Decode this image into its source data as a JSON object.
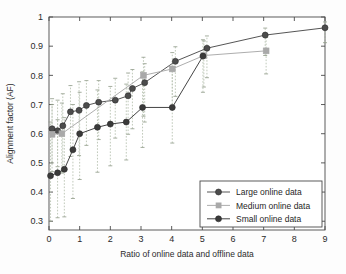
{
  "chart_data": {
    "type": "line",
    "title": "",
    "xlabel": "Ratio of online data and offline data",
    "ylabel": "Alignment factor (AF)",
    "xlim": [
      0,
      9
    ],
    "ylim": [
      0.27,
      1.0
    ],
    "xticks": [
      0,
      1,
      2,
      3,
      4,
      5,
      6,
      7,
      8,
      9
    ],
    "xticklabels": [
      "0",
      "1",
      "2",
      "3",
      "4",
      "5",
      "6",
      "7",
      "8",
      "9"
    ],
    "yticks": [
      0.3,
      0.4,
      0.5,
      0.6,
      0.7,
      0.8,
      0.9,
      1
    ],
    "yticklabels": [
      "0.3",
      "0.4",
      "0.5",
      "0.6",
      "0.7",
      "0.8",
      "0.9",
      "1"
    ],
    "grid": false,
    "legend_position": "lower right",
    "error_bars": "dashed vertical whisker lines, light gray-green",
    "series": [
      {
        "name": "Large online data",
        "color": "#4c4c4c",
        "marker": "filled-circle",
        "points": [
          {
            "x": 0.1,
            "y": 0.617,
            "err_low": 0.5,
            "err_high": 0.72
          },
          {
            "x": 0.28,
            "y": 0.61,
            "err_low": 0.487,
            "err_high": 0.715
          },
          {
            "x": 0.45,
            "y": 0.627,
            "err_low": 0.47,
            "err_high": 0.737
          },
          {
            "x": 0.7,
            "y": 0.675,
            "err_low": 0.522,
            "err_high": 0.765
          },
          {
            "x": 0.98,
            "y": 0.68,
            "err_low": 0.525,
            "err_high": 0.778
          },
          {
            "x": 1.22,
            "y": 0.697,
            "err_low": 0.56,
            "err_high": 0.782
          },
          {
            "x": 1.62,
            "y": 0.708,
            "err_low": 0.58,
            "err_high": 0.782
          },
          {
            "x": 2.16,
            "y": 0.715,
            "err_low": 0.585,
            "err_high": 0.79
          },
          {
            "x": 2.58,
            "y": 0.73,
            "err_low": 0.598,
            "err_high": 0.808
          },
          {
            "x": 2.72,
            "y": 0.755,
            "err_low": 0.617,
            "err_high": 0.82
          },
          {
            "x": 3.12,
            "y": 0.775,
            "err_low": 0.64,
            "err_high": 0.84
          },
          {
            "x": 4.12,
            "y": 0.848,
            "err_low": 0.728,
            "err_high": 0.898
          },
          {
            "x": 5.15,
            "y": 0.893,
            "err_low": 0.792,
            "err_high": 0.935
          },
          {
            "x": 7.05,
            "y": 0.938,
            "err_low": 0.868,
            "err_high": 0.962
          },
          {
            "x": 9.0,
            "y": 0.963,
            "err_low": 0.912,
            "err_high": 0.983
          }
        ]
      },
      {
        "name": "Medium online data",
        "color": "#a9a9a9",
        "marker": "filled-square",
        "points": [
          {
            "x": 0.1,
            "y": 0.598,
            "err_low": 0.47,
            "err_high": 0.7
          },
          {
            "x": 0.42,
            "y": 0.6,
            "err_low": 0.465,
            "err_high": 0.705
          },
          {
            "x": 3.08,
            "y": 0.8,
            "err_low": 0.66,
            "err_high": 0.862
          },
          {
            "x": 4.02,
            "y": 0.822,
            "err_low": 0.69,
            "err_high": 0.878
          },
          {
            "x": 5.05,
            "y": 0.868,
            "err_low": 0.76,
            "err_high": 0.918
          },
          {
            "x": 7.08,
            "y": 0.884,
            "err_low": 0.805,
            "err_high": 0.93
          }
        ]
      },
      {
        "name": "Small online data",
        "color": "#3a3a3a",
        "marker": "filled-circle",
        "points": [
          {
            "x": 0.05,
            "y": 0.456,
            "err_low": 0.3,
            "err_high": 0.64
          },
          {
            "x": 0.28,
            "y": 0.466,
            "err_low": 0.312,
            "err_high": 0.648
          },
          {
            "x": 0.5,
            "y": 0.478,
            "err_low": 0.315,
            "err_high": 0.655
          },
          {
            "x": 0.78,
            "y": 0.545,
            "err_low": 0.378,
            "err_high": 0.7
          },
          {
            "x": 1.0,
            "y": 0.6,
            "err_low": 0.443,
            "err_high": 0.742
          },
          {
            "x": 1.58,
            "y": 0.622,
            "err_low": 0.468,
            "err_high": 0.75
          },
          {
            "x": 2.0,
            "y": 0.633,
            "err_low": 0.49,
            "err_high": 0.762
          },
          {
            "x": 2.52,
            "y": 0.64,
            "err_low": 0.51,
            "err_high": 0.77
          },
          {
            "x": 3.05,
            "y": 0.69,
            "err_low": 0.553,
            "err_high": 0.812
          },
          {
            "x": 4.02,
            "y": 0.69,
            "err_low": 0.568,
            "err_high": 0.83
          },
          {
            "x": 5.02,
            "y": 0.866,
            "err_low": 0.742,
            "err_high": 0.922
          }
        ]
      }
    ]
  },
  "legend": {
    "items": [
      {
        "label": "Large online data"
      },
      {
        "label": "Medium online data"
      },
      {
        "label": "Small online data"
      }
    ]
  }
}
